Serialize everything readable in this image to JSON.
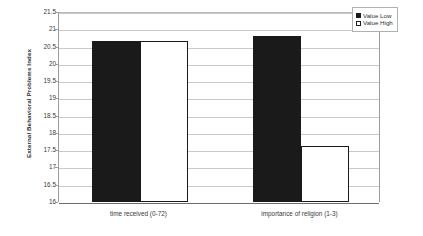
{
  "chart_data": {
    "type": "bar",
    "title": "",
    "xlabel": "",
    "ylabel": "External Behavioral Problems Index",
    "ylim": [
      16,
      21.5
    ],
    "ytick_step": 0.5,
    "yticks": [
      "21.5",
      "21",
      "20.5",
      "20",
      "19.5",
      "19",
      "18.5",
      "18",
      "17.5",
      "17",
      "16.5",
      "16"
    ],
    "grid": "horizontal",
    "legend_position": "top-right-outside",
    "categories": [
      "time received (0-72)",
      "importance of religion (1-3)"
    ],
    "series": [
      {
        "name": "Value Low",
        "color": "#1a1a1a",
        "fill": "solid-black",
        "values": [
          20.65,
          20.8
        ]
      },
      {
        "name": "Value High",
        "color": "#ffffff",
        "fill": "white-outlined",
        "values": [
          20.65,
          17.63
        ]
      }
    ]
  },
  "legend": {
    "items": [
      {
        "label": "Value Low"
      },
      {
        "label": "Value High"
      }
    ]
  }
}
